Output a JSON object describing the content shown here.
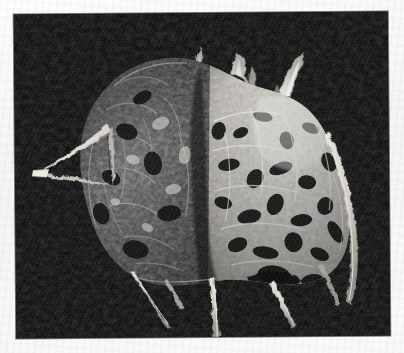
{
  "page": {
    "width_px": 404,
    "height_px": 353,
    "media_type": "scanned-photographic-plate",
    "paper_color": "#f7f7f8",
    "plate_background_color": "#090909"
  },
  "plate": {
    "frame": {
      "left_px": 15,
      "top_px": 13,
      "width_px": 374,
      "height_px": 324,
      "rotation_deg": -0.45,
      "border_color": "#000000"
    },
    "subject_name": "spiny reticulated specimen",
    "subject_description": "Irregular rounded skeletal object with an open meshwork surface, dark and weathered on the left half and bright chalky-white on the right half, bearing several tapering spines that project upward from the crown and long needle-like spines descending below.",
    "lighting": "strong directional light from the upper right against a black field",
    "tonal_range": {
      "background": "#080808",
      "darkest_specimen": "#101010",
      "midtone_specimen": "#6b6b6b",
      "brightest_specimen": "#f2f0ea"
    },
    "features": [
      {
        "id": "left-triangular-spine",
        "label": "triangular lateral spine (left)",
        "note": "Thin open triangle of filament projecting to the far left edge of the object."
      },
      {
        "id": "crown-spine-left",
        "label": "upper-left crown spine",
        "note": "Tall tapering spine rising from the top-left shoulder."
      },
      {
        "id": "crown-spine-center",
        "label": "upper-centre crown spine",
        "note": "Short forked spine at the top centre."
      },
      {
        "id": "crown-spine-right",
        "label": "upper-right crown spine",
        "note": "Bright curved horn-like spine leaning to the right."
      },
      {
        "id": "right-lateral-spine",
        "label": "right lateral spine",
        "note": "Long slender spine running down the right flank."
      },
      {
        "id": "ventral-spine-left",
        "label": "lower-left ventral spine",
        "note": "Fine needle descending to the lower left."
      },
      {
        "id": "ventral-spine-centre",
        "label": "lower-centre ventral spine",
        "note": "Longest needle, reaching the bottom edge of the plate."
      },
      {
        "id": "ventral-spine-right",
        "label": "lower-right ventral spine",
        "note": "Fine needle descending to the lower right."
      },
      {
        "id": "dark-hemisphere",
        "label": "dark weathered hemisphere",
        "note": "Left portion of the test, heavily shadowed with a coarse porous texture."
      },
      {
        "id": "bright-hemisphere",
        "label": "bright reticulated hemisphere",
        "note": "Right portion of the test, brilliantly lit, showing an open lattice of chambers and pores."
      }
    ]
  },
  "caption": {
    "text": ""
  }
}
